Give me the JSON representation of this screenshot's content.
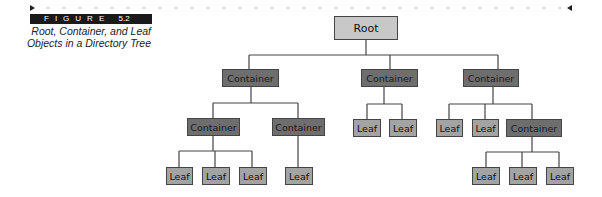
{
  "figure": {
    "label": "FIGURE",
    "number": "5.2",
    "caption_line1": "Root, Container, and Leaf",
    "caption_line2": "Objects in a Directory Tree"
  },
  "colors": {
    "root": "#c8c8c8",
    "container": "#6e6e6e",
    "leaf": "#a3a3a3",
    "line": "#444444",
    "banner": "#1a1a1a"
  },
  "tree": {
    "root": {
      "label": "Root"
    },
    "c1": {
      "label": "Container"
    },
    "c2": {
      "label": "Container"
    },
    "c3": {
      "label": "Container"
    },
    "c1a": {
      "label": "Container"
    },
    "c1b": {
      "label": "Container"
    },
    "c3c": {
      "label": "Container"
    },
    "l1a1": {
      "label": "Leaf"
    },
    "l1a2": {
      "label": "Leaf"
    },
    "l1a3": {
      "label": "Leaf"
    },
    "l1b1": {
      "label": "Leaf"
    },
    "l21": {
      "label": "Leaf"
    },
    "l22": {
      "label": "Leaf"
    },
    "l31": {
      "label": "Leaf"
    },
    "l32": {
      "label": "Leaf"
    },
    "l3c1": {
      "label": "Leaf"
    },
    "l3c2": {
      "label": "Leaf"
    },
    "l3c3": {
      "label": "Leaf"
    }
  }
}
